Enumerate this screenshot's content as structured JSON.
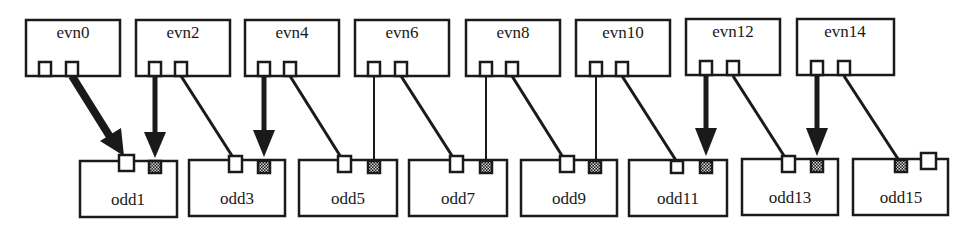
{
  "diagram": {
    "type": "process-connection-graph",
    "colors": {
      "stroke": "#1a1a1a",
      "background": "#ffffff",
      "port_open": "#ffffff",
      "port_filled": "#1a1a1a",
      "port_filled_pattern": "#d8d8d8"
    },
    "top_row": [
      {
        "id": "evn0",
        "label": "evn0"
      },
      {
        "id": "evn2",
        "label": "evn2"
      },
      {
        "id": "evn4",
        "label": "evn4"
      },
      {
        "id": "evn6",
        "label": "evn6"
      },
      {
        "id": "evn8",
        "label": "evn8"
      },
      {
        "id": "evn10",
        "label": "evn10"
      },
      {
        "id": "evn12",
        "label": "evn12"
      },
      {
        "id": "evn14",
        "label": "evn14"
      }
    ],
    "bottom_row": [
      {
        "id": "odd1",
        "label": "odd1"
      },
      {
        "id": "odd3",
        "label": "odd3"
      },
      {
        "id": "odd5",
        "label": "odd5"
      },
      {
        "id": "odd7",
        "label": "odd7"
      },
      {
        "id": "odd9",
        "label": "odd9"
      },
      {
        "id": "odd11",
        "label": "odd11"
      },
      {
        "id": "odd13",
        "label": "odd13"
      },
      {
        "id": "odd15",
        "label": "odd15"
      }
    ],
    "edges": [
      {
        "from": "evn0.port2",
        "to": "odd1.open",
        "style": "thick-arrow"
      },
      {
        "from": "evn2.port1",
        "to": "odd1.filled",
        "style": "thick-arrow"
      },
      {
        "from": "evn2.port2",
        "to": "odd3.open",
        "style": "line"
      },
      {
        "from": "evn4.port1",
        "to": "odd3.filled",
        "style": "thick-arrow"
      },
      {
        "from": "evn4.port2",
        "to": "odd5.open",
        "style": "line"
      },
      {
        "from": "evn6.port1",
        "to": "odd5.filled",
        "style": "thin-line"
      },
      {
        "from": "evn6.port2",
        "to": "odd7.open",
        "style": "line"
      },
      {
        "from": "evn8.port1",
        "to": "odd7.filled",
        "style": "thin-line"
      },
      {
        "from": "evn8.port2",
        "to": "odd9.open",
        "style": "line"
      },
      {
        "from": "evn10.port1",
        "to": "odd9.filled",
        "style": "thin-line"
      },
      {
        "from": "evn10.port2",
        "to": "odd11.open",
        "style": "line"
      },
      {
        "from": "evn12.port1",
        "to": "odd11.filled",
        "style": "thick-arrow"
      },
      {
        "from": "evn12.port2",
        "to": "odd13.open",
        "style": "line"
      },
      {
        "from": "evn14.port1",
        "to": "odd13.filled",
        "style": "thick-arrow"
      },
      {
        "from": "evn14.port2",
        "to": "odd15.filled",
        "style": "line"
      }
    ]
  }
}
